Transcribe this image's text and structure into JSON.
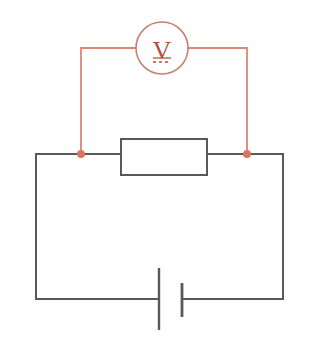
{
  "diagram": {
    "type": "circuit-schematic",
    "canvas": {
      "width": 313,
      "height": 340,
      "background": "#ffffff"
    },
    "colors": {
      "wire_main": "#58595b",
      "wire_meter": "#d98878",
      "meter_outline": "#c98070",
      "meter_symbol": "#b5503c",
      "node_fill": "#d9765e",
      "component_outline": "#58595b",
      "component_fill": "#ffffff"
    },
    "components": [
      {
        "id": "voltmeter",
        "name": "Voltmeter",
        "symbol_letter": "V",
        "symbol_mode": "DC",
        "shape": "circle",
        "center": {
          "x": 162,
          "y": 48
        },
        "radius": 26
      },
      {
        "id": "resistor",
        "name": "Resistor",
        "symbol_letter": "",
        "shape": "rectangle",
        "bounds": {
          "x": 121,
          "y": 139,
          "width": 86,
          "height": 36
        }
      },
      {
        "id": "battery",
        "name": "Battery / DC source",
        "shape": "battery-cell",
        "long_plate": {
          "x": 159,
          "y_top": 268,
          "y_bottom": 330
        },
        "short_plate": {
          "x": 182,
          "y_top": 283,
          "y_bottom": 317
        }
      }
    ],
    "nodes": [
      {
        "id": "node-left",
        "name": "left-probe-junction",
        "x": 81,
        "y": 154,
        "radius": 4
      },
      {
        "id": "node-right",
        "name": "right-probe-junction",
        "x": 247,
        "y": 154,
        "radius": 4
      }
    ],
    "wires": [
      {
        "id": "meter-left-lead",
        "color_role": "wire_meter",
        "path": "M81,154 L81,48 L136,48"
      },
      {
        "id": "meter-right-lead",
        "color_role": "wire_meter",
        "path": "M188,48 L247,48 L247,154"
      },
      {
        "id": "main-top-left",
        "color_role": "wire_main",
        "path": "M36,154 L121,154"
      },
      {
        "id": "main-top-right",
        "color_role": "wire_main",
        "path": "M207,154 L283,154"
      },
      {
        "id": "main-left-side",
        "color_role": "wire_main",
        "path": "M36,154 L36,299"
      },
      {
        "id": "main-right-side",
        "color_role": "wire_main",
        "path": "M283,154 L283,299"
      },
      {
        "id": "main-bottom-left",
        "color_role": "wire_main",
        "path": "M36,299 L159,299"
      },
      {
        "id": "main-bottom-right",
        "color_role": "wire_main",
        "path": "M182,299 L283,299"
      }
    ],
    "labels": {
      "voltmeter": "V",
      "dc_indicator": "DC"
    }
  }
}
